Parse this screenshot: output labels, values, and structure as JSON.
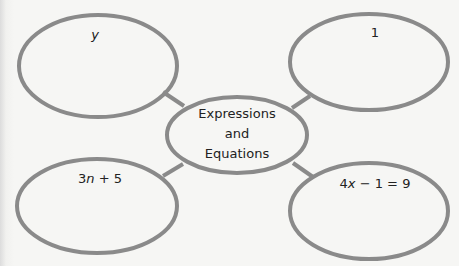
{
  "diagram": {
    "type": "concept-web",
    "stroke_color": "#8a8a8a",
    "background": "#f6f6f4",
    "center": {
      "lines": [
        "Expressions",
        "and",
        "Equations"
      ]
    },
    "nodes": [
      {
        "position": "top-left",
        "text": "y"
      },
      {
        "position": "top-right",
        "text": "1"
      },
      {
        "position": "bottom-left",
        "text": "3n + 5"
      },
      {
        "position": "bottom-right",
        "text": "4x − 1 = 9"
      }
    ]
  }
}
